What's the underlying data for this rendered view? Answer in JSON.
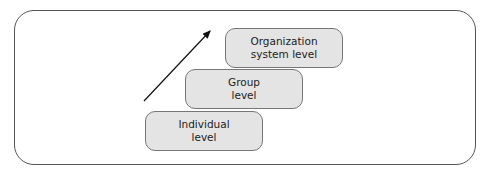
{
  "diagram": {
    "levels": [
      {
        "line1": "Individual",
        "line2": "level"
      },
      {
        "line1": "Group",
        "line2": "level"
      },
      {
        "line1": "Organization",
        "line2": "system level"
      }
    ],
    "arrow": {
      "direction": "up-right"
    },
    "colors": {
      "box_fill": "#e4e4e4",
      "box_border": "#777777",
      "frame_border": "#555555"
    }
  }
}
